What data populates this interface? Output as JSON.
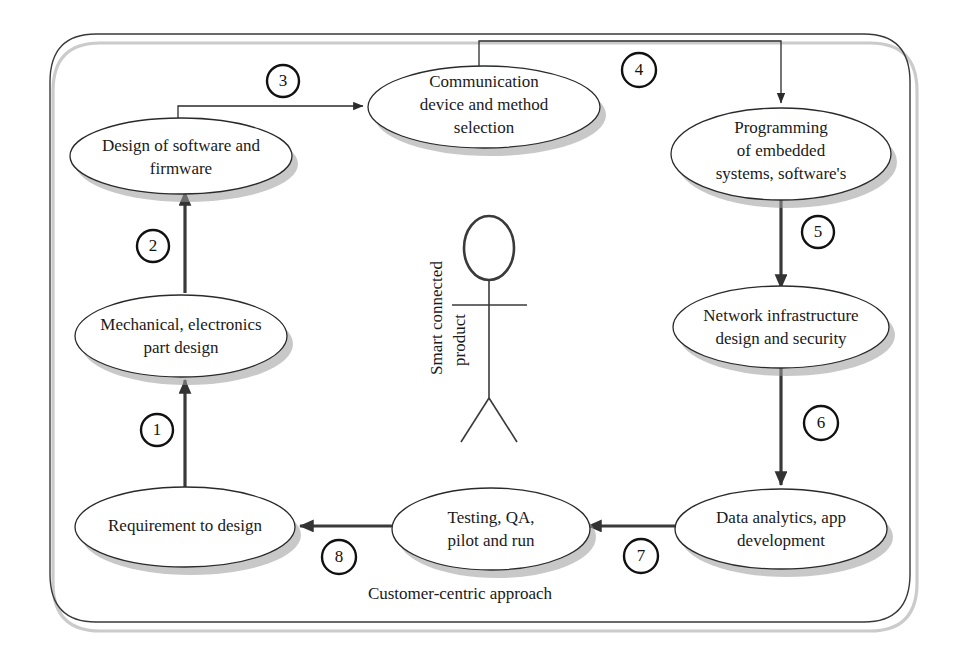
{
  "diagram": {
    "title_caption": "Customer-centric approach",
    "actor_label_line1": "Smart connected",
    "actor_label_line2": "product",
    "nodes": [
      {
        "id": "design-software-firmware",
        "lines": [
          "Design of software and",
          "firmware"
        ]
      },
      {
        "id": "communication-device-method",
        "lines": [
          "Communication",
          "device and method",
          "selection"
        ]
      },
      {
        "id": "programming-embedded-systems",
        "lines": [
          "Programming",
          "of embedded",
          "systems, software's"
        ]
      },
      {
        "id": "mechanical-electronics-part-design",
        "lines": [
          "Mechanical, electronics",
          "part design"
        ]
      },
      {
        "id": "network-infrastructure-security",
        "lines": [
          "Network infrastructure",
          "design and security"
        ]
      },
      {
        "id": "requirement-to-design",
        "lines": [
          "Requirement to design"
        ]
      },
      {
        "id": "testing-qa-pilot-run",
        "lines": [
          "Testing, QA,",
          "pilot and run"
        ]
      },
      {
        "id": "data-analytics-app-development",
        "lines": [
          "Data analytics, app",
          "development"
        ]
      }
    ],
    "steps": [
      {
        "number": "1",
        "from": "requirement-to-design",
        "to": "mechanical-electronics-part-design"
      },
      {
        "number": "2",
        "from": "mechanical-electronics-part-design",
        "to": "design-software-firmware"
      },
      {
        "number": "3",
        "from": "design-software-firmware",
        "to": "communication-device-method"
      },
      {
        "number": "4",
        "from": "communication-device-method",
        "to": "programming-embedded-systems"
      },
      {
        "number": "5",
        "from": "programming-embedded-systems",
        "to": "network-infrastructure-security"
      },
      {
        "number": "6",
        "from": "network-infrastructure-security",
        "to": "data-analytics-app-development"
      },
      {
        "number": "7",
        "from": "data-analytics-app-development",
        "to": "testing-qa-pilot-run"
      },
      {
        "number": "8",
        "from": "testing-qa-pilot-run",
        "to": "requirement-to-design"
      }
    ],
    "colors": {
      "background": "#ffffff",
      "stroke": "#2b2b2b",
      "text": "#1a1a1a",
      "shadow": "#9a9a9a"
    }
  }
}
